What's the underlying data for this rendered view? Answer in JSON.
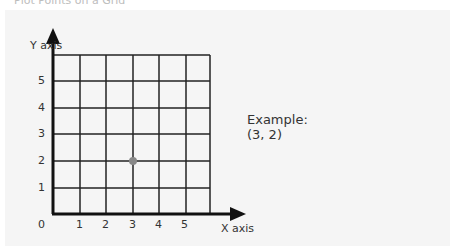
{
  "top_text": "Plot Points on a Grid",
  "diagram": {
    "y_axis_label": "Y axis",
    "x_axis_label": "X axis",
    "origin_label": "0",
    "x_ticks": [
      "1",
      "2",
      "3",
      "4",
      "5"
    ],
    "y_ticks": [
      "5",
      "4",
      "3",
      "2",
      "1"
    ],
    "point": {
      "x": 3,
      "y": 2,
      "color": "#888888"
    },
    "grid_color": "#222222",
    "axis_color": "#111111"
  },
  "example": {
    "title": "Example:",
    "coords": "(3, 2)"
  }
}
